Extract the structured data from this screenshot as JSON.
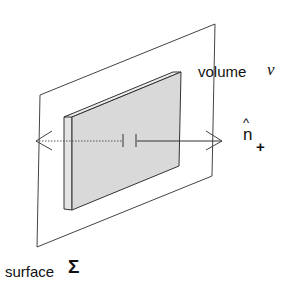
{
  "labels": {
    "volume": "volume",
    "volume_symbol": "ν",
    "normal": "n",
    "normal_hat": "^",
    "normal_sub": "+",
    "surface": "surface",
    "surface_symbol": "Σ"
  },
  "colors": {
    "line": "#333333",
    "slab": "#dcdcdc"
  }
}
